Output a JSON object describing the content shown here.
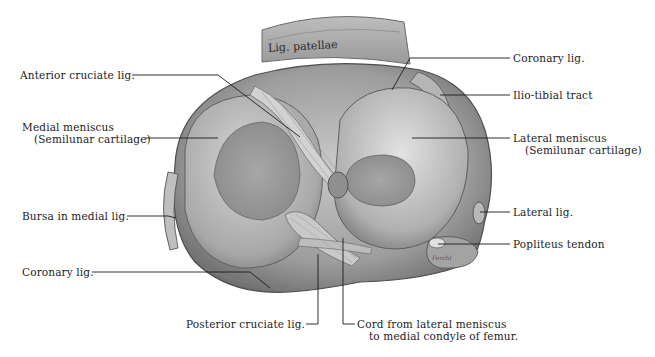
{
  "figure": {
    "inscription": "Lig. patellae",
    "signature": "Ferchl"
  },
  "labels": {
    "anterior_cruciate": {
      "text": "Anterior cruciate lig."
    },
    "medial_meniscus": {
      "line1": "Medial meniscus",
      "line2": "(Semilunar cartilage)"
    },
    "bursa_medial": {
      "text": "Bursa in medial lig."
    },
    "coronary_left": {
      "text": "Coronary lig."
    },
    "posterior_cruciate": {
      "text": "Posterior cruciate lig."
    },
    "cord": {
      "line1": "Cord from lateral meniscus",
      "line2": "to medial condyle of femur."
    },
    "coronary_right": {
      "text": "Coronary lig."
    },
    "iliotibial": {
      "text": "Ilio-tibial tract"
    },
    "lateral_meniscus": {
      "line1": "Lateral meniscus",
      "line2": "(Semilunar cartilage)"
    },
    "lateral_lig": {
      "text": "Lateral lig."
    },
    "popliteus": {
      "text": "Popliteus tendon"
    }
  },
  "colors": {
    "ink": "#1c1c1c",
    "tissue_light": "#d8d8d8",
    "tissue_mid": "#a9a9a9",
    "tissue_dark": "#6e6e6e",
    "background": "#ffffff"
  }
}
